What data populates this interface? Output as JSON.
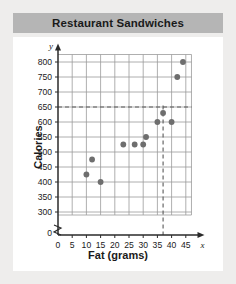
{
  "header": {
    "title": "Restaurant Sandwiches"
  },
  "chart_data": {
    "type": "scatter",
    "title": "Restaurant Sandwiches",
    "xlabel": "Fat (grams)",
    "ylabel": "Calories",
    "x_axis_symbol": "x",
    "y_axis_symbol": "y",
    "xlim": [
      0,
      47
    ],
    "ylim": [
      275,
      825
    ],
    "y_axis_break": true,
    "y_origin_label": "0",
    "x_origin_label": "0",
    "grid": true,
    "xticks": [
      0,
      5,
      10,
      15,
      20,
      25,
      30,
      35,
      40,
      45
    ],
    "xtick_labels": [
      "0",
      "5",
      "10",
      "15",
      "20",
      "25",
      "30",
      "35",
      "40",
      "45"
    ],
    "yticks": [
      300,
      350,
      400,
      450,
      500,
      550,
      600,
      650,
      700,
      750,
      800
    ],
    "ytick_labels": [
      "300",
      "350",
      "400",
      "450",
      "500",
      "550",
      "600",
      "650",
      "700",
      "750",
      "800"
    ],
    "points": [
      {
        "x": 10,
        "y": 425
      },
      {
        "x": 12,
        "y": 475
      },
      {
        "x": 15,
        "y": 400
      },
      {
        "x": 23,
        "y": 525
      },
      {
        "x": 27,
        "y": 525
      },
      {
        "x": 30,
        "y": 525
      },
      {
        "x": 31,
        "y": 550
      },
      {
        "x": 35,
        "y": 600
      },
      {
        "x": 37,
        "y": 630
      },
      {
        "x": 40,
        "y": 600
      },
      {
        "x": 42,
        "y": 750
      },
      {
        "x": 44,
        "y": 800
      }
    ],
    "reference_lines": [
      {
        "orientation": "horizontal",
        "value": 650,
        "style": "dashed"
      },
      {
        "orientation": "vertical",
        "value": 37,
        "style": "dashed"
      }
    ],
    "point_color": "#6e6e6e",
    "grid_color": "#9a9a9a",
    "axis_color": "#2a2a2a",
    "dash_color": "#5a5a5a"
  }
}
